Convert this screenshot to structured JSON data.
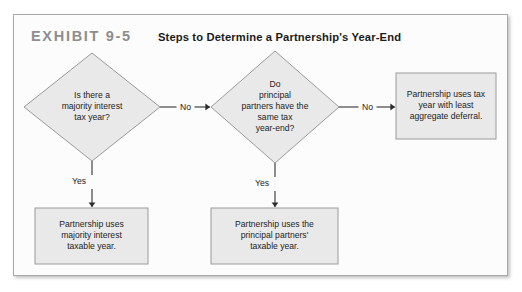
{
  "exhibit": {
    "label": "EXHIBIT 9-5",
    "title": "Steps to Determine a Partnership's Year-End"
  },
  "colors": {
    "node_fill": "#e9e9e9",
    "node_stroke": "#9a9a9a",
    "frame_stroke": "#a9a9a9",
    "label_gray": "#8d8d8d",
    "text": "#232323",
    "edge": "#3a3a3a",
    "background": "#ffffff"
  },
  "chart_data": {
    "type": "diagram",
    "title": "Steps to Determine a Partnership's Year-End",
    "nodes": [
      {
        "id": "d1",
        "shape": "diamond",
        "lines": [
          "Is there a",
          "majority interest",
          "tax year?"
        ],
        "cx": 78,
        "cy": 92,
        "rx": 68,
        "ry": 54
      },
      {
        "id": "d2",
        "shape": "diamond",
        "lines": [
          "Do",
          "principal",
          "partners have the",
          "same tax",
          "year-end?"
        ],
        "cx": 261,
        "cy": 92,
        "rx": 64,
        "ry": 56
      },
      {
        "id": "b_right",
        "shape": "rect",
        "lines": [
          "Partnership uses tax",
          "year with least",
          "aggregate deferral."
        ],
        "x": 382,
        "y": 58,
        "w": 100,
        "h": 66
      },
      {
        "id": "b_left",
        "shape": "rect",
        "lines": [
          "Partnership uses",
          "majority interest",
          "taxable year."
        ],
        "x": 21,
        "y": 193,
        "w": 113,
        "h": 56
      },
      {
        "id": "b_mid",
        "shape": "rect",
        "lines": [
          "Partnership uses the",
          "principal partners'",
          "taxable year."
        ],
        "x": 197,
        "y": 193,
        "w": 127,
        "h": 56
      }
    ],
    "edges": [
      {
        "id": "e1",
        "from": "d1",
        "to": "d2",
        "label": "No",
        "direction": "right"
      },
      {
        "id": "e2",
        "from": "d2",
        "to": "b_right",
        "label": "No",
        "direction": "right"
      },
      {
        "id": "e3",
        "from": "d1",
        "to": "b_left",
        "label": "Yes",
        "direction": "down"
      },
      {
        "id": "e4",
        "from": "d2",
        "to": "b_mid",
        "label": "Yes",
        "direction": "down"
      }
    ]
  }
}
